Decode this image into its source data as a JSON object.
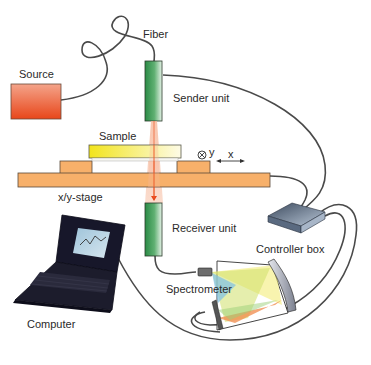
{
  "labels": {
    "fiber": "Fiber",
    "source": "Source",
    "sender_unit": "Sender unit",
    "sample": "Sample",
    "axis_y": "y",
    "axis_x": "x",
    "stage": "x/y-stage",
    "receiver_unit": "Receiver unit",
    "controller_box": "Controller box",
    "spectrometer": "Spectrometer",
    "computer": "Computer"
  },
  "colors": {
    "source_top": "#f0a080",
    "source_bottom": "#e8501e",
    "unit_green": "#2e8b4a",
    "unit_light": "#d8eede",
    "stage_orange": "#f7b06a",
    "sample_yellow": "#f5ea3a",
    "beam": "#f26a3a",
    "cable": "#4a4a4a",
    "controller": "#6a7d95"
  }
}
